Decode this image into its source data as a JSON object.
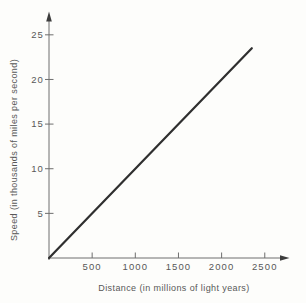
{
  "chart_data": {
    "type": "line",
    "title": "",
    "xlabel": "Distance (in millions of light years)",
    "ylabel": "Speed (in thousands of miles per second)",
    "x_ticks": [
      "500",
      "1000",
      "1500",
      "2000",
      "2500"
    ],
    "x_tick_values": [
      500,
      1000,
      1500,
      2000,
      2500
    ],
    "y_ticks": [
      "5",
      "10",
      "15",
      "20",
      "25"
    ],
    "y_tick_values": [
      5,
      10,
      15,
      20,
      25
    ],
    "xlim": [
      0,
      2775
    ],
    "ylim": [
      0,
      27.5
    ],
    "grid": false,
    "legend": "none",
    "series": [
      {
        "name": "speed-vs-distance-line",
        "x": [
          0,
          2350
        ],
        "y": [
          0,
          23.5
        ]
      }
    ],
    "colors": {
      "line": "#2f2f2f",
      "axis": "#6e6e6e",
      "text": "#585858",
      "background": "#fdfdfb"
    }
  }
}
